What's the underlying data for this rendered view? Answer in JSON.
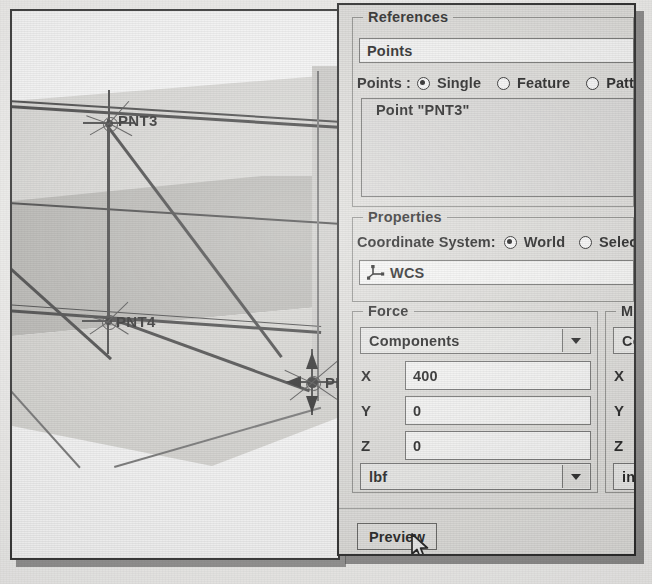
{
  "dialog": {
    "references": {
      "group_title": "References",
      "points_field": "Points",
      "points_row_label": "Points :",
      "options": [
        {
          "label": "Single",
          "selected": true
        },
        {
          "label": "Feature",
          "selected": false
        },
        {
          "label": "Patte",
          "selected": false
        }
      ],
      "list_items": [
        "Point \"PNT3\""
      ]
    },
    "properties": {
      "group_title": "Properties",
      "coord_label": "Coordinate System:",
      "options": [
        {
          "label": "World",
          "selected": true
        },
        {
          "label": "Selec",
          "selected": false
        }
      ],
      "csys_value": "WCS",
      "csys_icon": "coordinate-system-icon"
    },
    "force": {
      "group_title": "Force",
      "type": "Components",
      "rows": [
        {
          "axis": "X",
          "value": "400"
        },
        {
          "axis": "Y",
          "value": "0"
        },
        {
          "axis": "Z",
          "value": "0"
        }
      ],
      "units": "lbf"
    },
    "moment": {
      "group_title": "M",
      "type": "Co",
      "rows": [
        {
          "axis": "X",
          "value": ""
        },
        {
          "axis": "Y",
          "value": ""
        },
        {
          "axis": "Z",
          "value": ""
        }
      ],
      "units": "in"
    },
    "preview_button": "Preview"
  },
  "viewport": {
    "point_labels": [
      "PNT3",
      "PNT4",
      "PNT"
    ],
    "ghost_text": [
      "Translation of Force",
      "Step 4: Constraint Force",
      "which is not a problem",
      "in Structure in the m"
    ]
  },
  "colors": {
    "dialog_bg": "#e2e1de",
    "field_bg": "#fbfbfa",
    "face_light": "#dcdbd8",
    "face_mid": "#b9b8b4",
    "edge": "#3a3a3a"
  }
}
